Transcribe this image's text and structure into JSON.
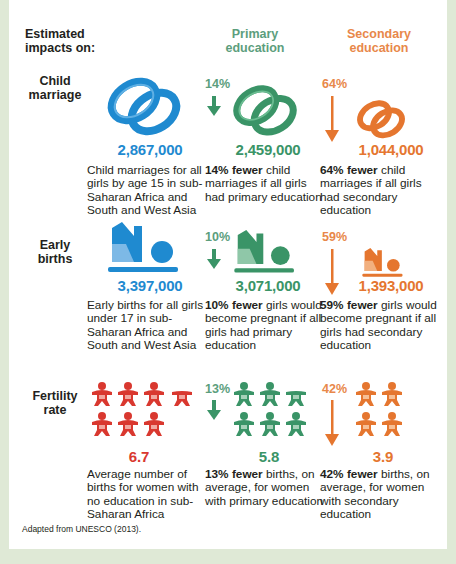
{
  "header": {
    "estimated": "Estimated impacts on:",
    "estimated_line1": "Estimated",
    "estimated_line2": "impacts on:",
    "primary_line1": "Primary",
    "primary_line2": "education",
    "secondary_line1": "Secondary",
    "secondary_line2": "education"
  },
  "colors": {
    "baseline_blue": "#1f8ad0",
    "primary_green": "#3a9467",
    "primary_header_green": "#5c9e7d",
    "secondary_orange": "#e5762f",
    "secondary_header_orange": "#e8884a",
    "fertility_red": "#d9382f",
    "border_green": "#dfe9d6"
  },
  "rows": [
    {
      "label_line1": "Child",
      "label_line2": "marriage",
      "icon": "rings-icon",
      "baseline": {
        "value": "2,867,000",
        "desc": "Child marriages for all girls by age 15 in sub-Saharan Africa and South and West Asia"
      },
      "primary": {
        "pct": "14%",
        "value": "2,459,000",
        "bold": "14% fewer",
        "desc": " child marriages if all girls had primary education"
      },
      "secondary": {
        "pct": "64%",
        "value": "1,044,000",
        "bold": "64% fewer",
        "desc": " child marriages if all girls had secondary education"
      }
    },
    {
      "label_line1": "Early",
      "label_line2": "births",
      "icon": "baby-lying-icon",
      "baseline": {
        "value": "3,397,000",
        "desc": "Early births for all girls under 17 in sub-Saharan Africa and South and West Asia"
      },
      "primary": {
        "pct": "10%",
        "value": "3,071,000",
        "bold": "10% fewer",
        "desc": " girls would become pregnant if all girls had primary education"
      },
      "secondary": {
        "pct": "59%",
        "value": "1,393,000",
        "bold": "59% fewer",
        "desc": " girls would become pregnant if all girls had secondary education"
      }
    },
    {
      "label_line1": "Fertility",
      "label_line2": "rate",
      "icon": "baby-icon",
      "baseline": {
        "value": "6.7",
        "desc": "Average number of births for women with no education in sub-Saharan Africa"
      },
      "primary": {
        "pct": "13%",
        "value": "5.8",
        "bold": "13% fewer",
        "desc": " births, on average, for women with primary education"
      },
      "secondary": {
        "pct": "42%",
        "value": "3.9",
        "bold": "42% fewer",
        "desc": " births, on average, for women with secondary education"
      }
    }
  ],
  "credit": "Adapted from UNESCO (2013)."
}
